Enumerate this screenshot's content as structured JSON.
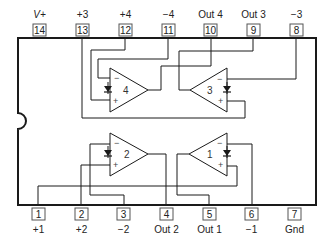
{
  "diagram": {
    "type": "ic-pinout",
    "colors": {
      "line": "#1a1a1a",
      "pin_box": "#555555",
      "background": "#ffffff"
    },
    "top_pins": [
      {
        "number": "14",
        "label": "V+"
      },
      {
        "number": "13",
        "label": "+3"
      },
      {
        "number": "12",
        "label": "+4"
      },
      {
        "number": "11",
        "label": "−4"
      },
      {
        "number": "10",
        "label": "Out 4"
      },
      {
        "number": "9",
        "label": "Out 3"
      },
      {
        "number": "8",
        "label": "−3"
      }
    ],
    "bottom_pins": [
      {
        "number": "1",
        "label": "+1"
      },
      {
        "number": "2",
        "label": "+2"
      },
      {
        "number": "3",
        "label": "−2"
      },
      {
        "number": "4",
        "label": "Out 2"
      },
      {
        "number": "5",
        "label": "Out 1"
      },
      {
        "number": "6",
        "label": "−1"
      },
      {
        "number": "7",
        "label": "Gnd"
      }
    ],
    "opamps": [
      {
        "id": "4",
        "label": "4",
        "minus": "−",
        "plus": "+"
      },
      {
        "id": "3",
        "label": "3",
        "minus": "−",
        "plus": "+"
      },
      {
        "id": "2",
        "label": "2",
        "minus": "−",
        "plus": "+"
      },
      {
        "id": "1",
        "label": "1",
        "minus": "−",
        "plus": "+"
      }
    ]
  }
}
